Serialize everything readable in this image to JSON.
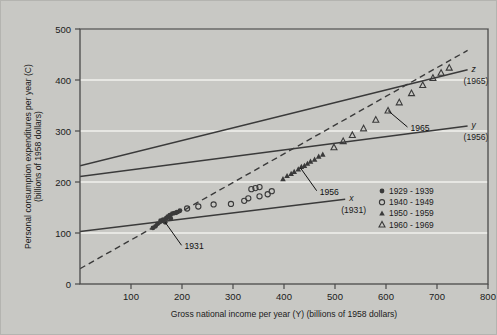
{
  "figure": {
    "background_color": "#c8c8c4",
    "plot_background_color": "#c8c8c4",
    "frame_color": "#4a4a4a",
    "gridline_color": "#f2f2ee",
    "series_color": "#3a3a3a"
  },
  "chart_data": {
    "type": "scatter",
    "title": "",
    "xlabel": "Gross national income per year (Y) (billions of 1958 dollars)",
    "ylabel": "Personal consumption expenditures per year (C) (billions of 1958 dollars)",
    "xlim": [
      0,
      800
    ],
    "ylim": [
      0,
      500
    ],
    "xticks": [
      100,
      200,
      300,
      400,
      500,
      600,
      700,
      800
    ],
    "yticks": [
      0,
      100,
      200,
      300,
      400,
      500
    ],
    "grid": "horizontal",
    "legend_position": "lower-right",
    "legend": [
      {
        "label": "1929 - 1939",
        "marker": "filled-circle"
      },
      {
        "label": "1940 - 1949",
        "marker": "open-circle"
      },
      {
        "label": "1950 - 1959",
        "marker": "filled-triangle"
      },
      {
        "label": "1960 - 1969",
        "marker": "open-triangle"
      }
    ],
    "series": [
      {
        "name": "1929 - 1939",
        "marker": "filled-circle",
        "points": [
          [
            152,
            118
          ],
          [
            158,
            124
          ],
          [
            163,
            126
          ],
          [
            169,
            129
          ],
          [
            172,
            132
          ],
          [
            176,
            135
          ],
          [
            181,
            138
          ],
          [
            185,
            139
          ],
          [
            190,
            141
          ],
          [
            196,
            144
          ],
          [
            148,
            113
          ],
          [
            143,
            110
          ],
          [
            167,
            121
          ],
          [
            178,
            128
          ]
        ]
      },
      {
        "name": "1940 - 1949",
        "marker": "open-circle",
        "points": [
          [
            210,
            148
          ],
          [
            232,
            152
          ],
          [
            262,
            156
          ],
          [
            296,
            157
          ],
          [
            330,
            168
          ],
          [
            352,
            172
          ],
          [
            368,
            176
          ],
          [
            376,
            182
          ],
          [
            352,
            190
          ],
          [
            344,
            188
          ],
          [
            336,
            186
          ],
          [
            322,
            163
          ]
        ]
      },
      {
        "name": "1950 - 1959",
        "marker": "filled-triangle",
        "points": [
          [
            398,
            206
          ],
          [
            406,
            212
          ],
          [
            414,
            216
          ],
          [
            420,
            220
          ],
          [
            428,
            225
          ],
          [
            434,
            230
          ],
          [
            440,
            232
          ],
          [
            446,
            236
          ],
          [
            452,
            240
          ],
          [
            460,
            244
          ],
          [
            468,
            250
          ],
          [
            476,
            254
          ]
        ]
      },
      {
        "name": "1960 - 1969",
        "marker": "open-triangle",
        "points": [
          [
            498,
            268
          ],
          [
            516,
            280
          ],
          [
            534,
            292
          ],
          [
            556,
            305
          ],
          [
            580,
            322
          ],
          [
            604,
            340
          ],
          [
            626,
            356
          ],
          [
            650,
            374
          ],
          [
            672,
            390
          ],
          [
            692,
            404
          ],
          [
            708,
            414
          ],
          [
            724,
            424
          ]
        ]
      }
    ],
    "reference_lines": [
      {
        "id": "x",
        "label": "x",
        "year_label": "(1931)",
        "x0": 0,
        "y0": 103,
        "x1": 520,
        "y1": 166
      },
      {
        "id": "y",
        "label": "y",
        "year_label": "(1956)",
        "x0": 0,
        "y0": 211,
        "x1": 760,
        "y1": 310
      },
      {
        "id": "z",
        "label": "z",
        "year_label": "(1965)",
        "x0": 0,
        "y0": 232,
        "x1": 760,
        "y1": 420
      }
    ],
    "trend_line": {
      "style": "dashed",
      "x0": 0,
      "y0": 30,
      "x1": 760,
      "y1": 458
    },
    "annotations": [
      {
        "label": "1931",
        "point_x": 167,
        "point_y": 121,
        "text_x": 205,
        "text_y": 68
      },
      {
        "label": "1956",
        "point_x": 432,
        "point_y": 228,
        "text_x": 470,
        "text_y": 175
      },
      {
        "label": "1965",
        "point_x": 604,
        "point_y": 340,
        "text_x": 648,
        "text_y": 300
      }
    ]
  }
}
